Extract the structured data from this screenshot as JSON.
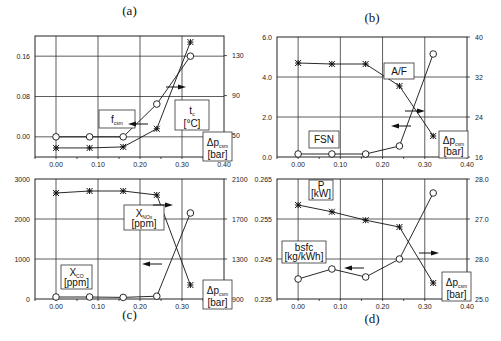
{
  "chart_data": [
    {
      "panel": "(a)",
      "type": "line",
      "x": [
        0.0,
        0.08,
        0.16,
        0.24,
        0.32
      ],
      "xlabel": "Δp_csm [bar]",
      "xlim": [
        -0.05,
        0.4
      ],
      "xticks": [
        "0.00",
        "0.10",
        "0.20",
        "0.30",
        "0.40"
      ],
      "left_axis": {
        "label": "f_csm",
        "ylim": [
          -0.04,
          0.2
        ],
        "ticks": [
          "0.00",
          "0.08",
          "0.16"
        ]
      },
      "right_axis": {
        "label": "t_c [°C]",
        "ylim": [
          30,
          150
        ],
        "ticks": [
          "50",
          "90",
          "130"
        ]
      },
      "series": [
        {
          "name": "f_csm",
          "axis": "left",
          "marker": "circle",
          "values": [
            0.0,
            0.0,
            0.0,
            0.065,
            0.16
          ]
        },
        {
          "name": "t_c",
          "axis": "right",
          "marker": "star",
          "values": [
            39,
            39,
            40,
            58,
            144
          ]
        }
      ],
      "grid": true
    },
    {
      "panel": "(b)",
      "type": "line",
      "x": [
        0.0,
        0.08,
        0.16,
        0.24,
        0.32
      ],
      "xlabel": "Δp_csm [bar]",
      "xlim": [
        -0.05,
        0.4
      ],
      "xticks": [
        "0.00",
        "0.10",
        "0.20",
        "0.30",
        "0.40"
      ],
      "left_axis": {
        "label": "FSN",
        "ylim": [
          0,
          6
        ],
        "ticks": [
          "0.0",
          "2.0",
          "4.0",
          "6.0"
        ]
      },
      "right_axis": {
        "label": "A/F",
        "ylim": [
          16,
          40
        ],
        "ticks": [
          "16",
          "24",
          "32",
          "40"
        ]
      },
      "series": [
        {
          "name": "FSN",
          "axis": "left",
          "marker": "circle",
          "values": [
            0.15,
            0.15,
            0.15,
            0.55,
            5.15
          ]
        },
        {
          "name": "A/F",
          "axis": "right",
          "marker": "star",
          "values": [
            34.8,
            34.6,
            34.6,
            30.2,
            20.2
          ]
        }
      ],
      "grid": true
    },
    {
      "panel": "(c)",
      "type": "line",
      "x": [
        0.0,
        0.08,
        0.16,
        0.24,
        0.32
      ],
      "xlabel": "Δp_csm [bar]",
      "xlim": [
        -0.05,
        0.4
      ],
      "xticks": [
        "0.00",
        "0.10",
        "0.20",
        "0.30",
        "0.40"
      ],
      "left_axis": {
        "label": "X_CO [ppm]",
        "ylim": [
          0,
          3000
        ],
        "ticks": [
          "0",
          "1000",
          "2000",
          "3000"
        ]
      },
      "right_axis": {
        "label": "X_NOx [ppm]",
        "ylim": [
          900,
          2100
        ],
        "ticks": [
          "900",
          "1300",
          "1700",
          "2100"
        ]
      },
      "series": [
        {
          "name": "X_CO",
          "axis": "left",
          "marker": "circle",
          "values": [
            50,
            50,
            40,
            70,
            2150
          ]
        },
        {
          "name": "X_NOx",
          "axis": "right",
          "marker": "star",
          "values": [
            1960,
            1980,
            1980,
            1940,
            1040
          ]
        }
      ],
      "grid": true
    },
    {
      "panel": "(d)",
      "type": "line",
      "x": [
        0.0,
        0.08,
        0.16,
        0.24,
        0.32
      ],
      "xlabel": "Δp_csm [bar]",
      "xlim": [
        -0.05,
        0.4
      ],
      "xticks": [
        "0.00",
        "0.10",
        "0.20",
        "0.30",
        "0.40"
      ],
      "left_axis": {
        "label": "bsfc [kg/kWh]",
        "ylim": [
          0.235,
          0.265
        ],
        "ticks": [
          "0.235",
          "0.245",
          "0.255",
          "0.265"
        ]
      },
      "right_axis": {
        "label": "P [kW]",
        "ylim": [
          25,
          28
        ],
        "ticks": [
          "25.0",
          "28.0",
          "27.0",
          "28.0"
        ]
      },
      "series": [
        {
          "name": "bsfc",
          "axis": "left",
          "marker": "circle",
          "values": [
            0.24,
            0.2425,
            0.2405,
            0.245,
            0.2615
          ]
        },
        {
          "name": "P",
          "axis": "right",
          "marker": "star",
          "values": [
            27.35,
            27.18,
            26.97,
            26.8,
            25.4
          ]
        }
      ],
      "grid": true
    }
  ],
  "panels": [
    {
      "title": "(a)",
      "labels": {
        "left_main": "f",
        "left_sub": "csm",
        "right_main": "t",
        "right_sub": "c",
        "right_unit": "[°C]",
        "x_main": "Δp",
        "x_sub": "csm",
        "x_unit": "[bar]"
      }
    },
    {
      "title": "(b)",
      "labels": {
        "left_main": "FSN",
        "right_main": "A/F",
        "x_main": "Δp",
        "x_sub": "csm",
        "x_unit": "[bar]"
      }
    },
    {
      "title": "(c)",
      "labels": {
        "left_main": "X",
        "left_sub": "CO",
        "left_unit": "[ppm]",
        "right_main": "X",
        "right_sub": "NOx",
        "right_unit": "[ppm]",
        "x_main": "Δp",
        "x_sub": "csm",
        "x_unit": "[bar]"
      }
    },
    {
      "title": "(d)",
      "labels": {
        "left_main": "bsfc",
        "left_unit": "[kg/kWh]",
        "right_main": "P",
        "right_unit": "[kW]",
        "x_main": "Δp",
        "x_sub": "csm",
        "x_unit": "[bar]"
      }
    }
  ]
}
